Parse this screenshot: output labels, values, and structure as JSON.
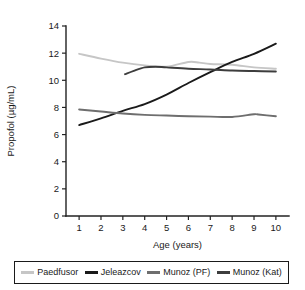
{
  "chart_data": {
    "type": "line",
    "title": "",
    "xlabel": "Age (years)",
    "ylabel": "Propofol (µg/mL)",
    "xlim": [
      0.4,
      10.6
    ],
    "ylim": [
      0,
      14
    ],
    "xticks": [
      1,
      2,
      3,
      4,
      5,
      6,
      7,
      8,
      9,
      10
    ],
    "yticks": [
      0,
      2,
      4,
      6,
      8,
      10,
      12,
      14
    ],
    "xtick_labels": [
      "1",
      "2",
      "3",
      "4",
      "5",
      "6",
      "7",
      "8",
      "9",
      "10"
    ],
    "ytick_labels": [
      "0",
      "2",
      "4",
      "6",
      "8",
      "10",
      "12",
      "14"
    ],
    "grid": false,
    "legend_position": "bottom",
    "series": [
      {
        "name": "Paedfusor",
        "color": "#c6c6c6",
        "x": [
          1,
          2,
          3,
          4,
          5,
          6,
          6.5,
          7,
          8,
          9,
          10
        ],
        "values": [
          11.95,
          11.6,
          11.3,
          11.1,
          11.0,
          11.35,
          11.3,
          11.2,
          11.15,
          10.95,
          10.85
        ]
      },
      {
        "name": "Jeleazcov",
        "color": "#1a1a1a",
        "x": [
          1,
          2,
          3,
          4,
          5,
          6,
          7,
          8,
          9,
          10
        ],
        "values": [
          6.7,
          7.2,
          7.75,
          8.25,
          8.95,
          9.8,
          10.6,
          11.35,
          11.95,
          12.7
        ]
      },
      {
        "name": "Munoz (PF)",
        "color": "#6e6e6e",
        "x": [
          1,
          2,
          3,
          4,
          5,
          6,
          7,
          8,
          9,
          9.2,
          10
        ],
        "values": [
          7.85,
          7.7,
          7.55,
          7.45,
          7.4,
          7.35,
          7.32,
          7.3,
          7.5,
          7.48,
          7.35
        ]
      },
      {
        "name": "Munoz (Kat)",
        "color": "#3d3d3d",
        "x": [
          3.1,
          3.5,
          4,
          4.5,
          5,
          6,
          7,
          8,
          9,
          10
        ],
        "values": [
          10.45,
          10.7,
          10.95,
          11.0,
          10.95,
          10.85,
          10.8,
          10.72,
          10.68,
          10.65
        ]
      }
    ]
  },
  "legend": {
    "entries": [
      {
        "label": "Paedfusor",
        "color": "#c6c6c6"
      },
      {
        "label": "Jeleazcov",
        "color": "#1a1a1a"
      },
      {
        "label": "Munoz (PF)",
        "color": "#6e6e6e"
      },
      {
        "label": "Munoz (Kat)",
        "color": "#3d3d3d"
      }
    ]
  }
}
